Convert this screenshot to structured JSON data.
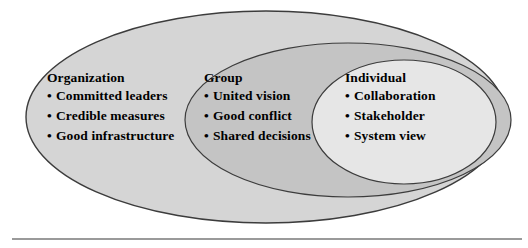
{
  "diagram": {
    "type": "nested-venn",
    "title": "",
    "rings": [
      {
        "id": "organization",
        "label": "Organization",
        "level": 1,
        "fill_color": "#d5d5d5",
        "stroke_color": "#3c3c3c",
        "items": [
          "Committed leaders",
          "Credible measures",
          "Good infrastructure"
        ]
      },
      {
        "id": "group",
        "label": "Group",
        "level": 2,
        "fill_color": "#c4c4c4",
        "stroke_color": "#3c3c3c",
        "items": [
          "United vision",
          "Good conflict",
          "Shared decisions"
        ]
      },
      {
        "id": "individual",
        "label": "Individual",
        "level": 3,
        "fill_color": "#e6e6e6",
        "stroke_color": "#3c3c3c",
        "items": [
          "Collaboration",
          "Stakeholder",
          "System view"
        ]
      }
    ],
    "bullet_glyph": "•",
    "divider": {
      "name": "horizontal-rule",
      "color": "#9a9a9a"
    },
    "background_color": "#ffffff"
  }
}
